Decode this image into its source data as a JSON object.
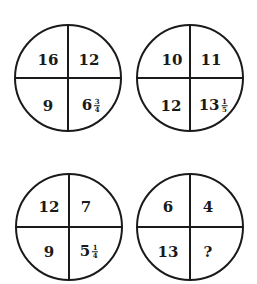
{
  "puzzle": {
    "circles": [
      {
        "id": "top-left",
        "center": [
          68,
          78
        ],
        "radius": 53,
        "cells": {
          "top_left": {
            "whole": "16"
          },
          "top_right": {
            "whole": "12"
          },
          "bottom_left": {
            "whole": "9"
          },
          "bottom_right": {
            "whole": "6",
            "num": "3",
            "den": "4"
          }
        }
      },
      {
        "id": "top-right",
        "center": [
          190,
          78
        ],
        "radius": 53,
        "cells": {
          "top_left": {
            "whole": "10"
          },
          "top_right": {
            "whole": "11"
          },
          "bottom_left": {
            "whole": "12"
          },
          "bottom_right": {
            "whole": "13",
            "num": "1",
            "den": "5"
          }
        }
      },
      {
        "id": "bottom-left",
        "center": [
          69,
          227
        ],
        "radius": 53,
        "cells": {
          "top_left": {
            "whole": "12"
          },
          "top_right": {
            "whole": "7"
          },
          "bottom_left": {
            "whole": "9"
          },
          "bottom_right": {
            "whole": "5",
            "num": "1",
            "den": "4"
          }
        }
      },
      {
        "id": "bottom-right",
        "center": [
          190,
          227
        ],
        "radius": 53,
        "cells": {
          "top_left": {
            "whole": "6"
          },
          "top_right": {
            "whole": "4"
          },
          "bottom_left": {
            "whole": "13"
          },
          "bottom_right": {
            "whole": "?"
          }
        }
      }
    ],
    "colors": {
      "stroke": "#1a1a1a",
      "text": "#1a1a1a",
      "background": "#ffffff"
    }
  }
}
